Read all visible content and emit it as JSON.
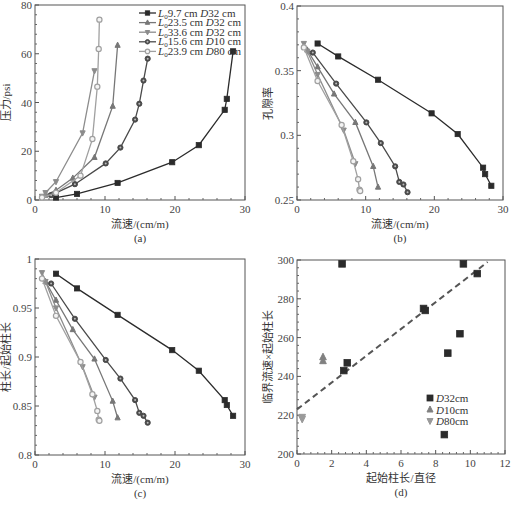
{
  "chart_data": [
    {
      "panel": "a",
      "type": "line",
      "caption": "(a)",
      "xlabel": "流速/(cm/m)",
      "ylabel": "压力/psi",
      "xlim": [
        0,
        30
      ],
      "ylim": [
        0,
        80
      ],
      "xticks": [
        0,
        10,
        20,
        30
      ],
      "yticks": [
        0,
        20,
        40,
        60,
        80
      ],
      "legend_position": "upper right",
      "series": [
        {
          "name": "L0 9.7 cm  D32 cm",
          "legend_main": "9.7 cm",
          "legend_d": "32 cm",
          "marker": "square",
          "color": "#2b2b2b",
          "x": [
            3,
            6,
            11.8,
            19.6,
            23.4,
            27.1,
            27.4,
            28.3
          ],
          "y": [
            1,
            2.5,
            7,
            15.5,
            22.5,
            37,
            41.5,
            61
          ]
        },
        {
          "name": "L0 23.5 cm  D32 cm",
          "legend_main": "23.5 cm",
          "legend_d": "32 cm",
          "marker": "triangle-up",
          "color": "#777777",
          "x": [
            1.5,
            3,
            5.4,
            8.5,
            11.1,
            11.8
          ],
          "y": [
            2,
            4,
            9,
            17.5,
            38.5,
            63.5
          ]
        },
        {
          "name": "L0 33.6 cm  D32 cm",
          "legend_main": "33.6 cm",
          "legend_d": "32 cm",
          "marker": "triangle-down",
          "color": "#8c8c8c",
          "x": [
            1,
            1.5,
            3,
            6.8,
            8.5
          ],
          "y": [
            1.5,
            3,
            7.5,
            27.5,
            53
          ]
        },
        {
          "name": "L0 15.6 cm  D10 cm",
          "legend_main": "15.6 cm",
          "legend_d": "10 cm",
          "marker": "circle-dot",
          "color": "#4a4a4a",
          "x": [
            2.3,
            5.7,
            10.1,
            12.2,
            14.3,
            14.9,
            15.5,
            16.1
          ],
          "y": [
            2,
            6.5,
            15,
            21.5,
            33,
            39.5,
            49,
            58
          ]
        },
        {
          "name": "L0 23.9 cm  D80 cm",
          "legend_main": "23.9 cm",
          "legend_d": "80 cm",
          "marker": "circle-open",
          "color": "#a0a0a0",
          "x": [
            1,
            3,
            6.5,
            8.2,
            8.9,
            9.1,
            9.2
          ],
          "y": [
            1,
            3,
            10,
            25,
            46.5,
            62,
            74
          ]
        }
      ]
    },
    {
      "panel": "b",
      "type": "line",
      "caption": "(b)",
      "xlabel": "流速/(cm/m)",
      "ylabel": "孔隙率",
      "xlim": [
        0,
        30
      ],
      "ylim": [
        0.25,
        0.4
      ],
      "xticks": [
        0,
        10,
        20,
        30
      ],
      "yticks": [
        0.25,
        0.3,
        0.35,
        0.4
      ],
      "series": [
        {
          "name": "L0 9.7 cm  D32 cm",
          "x": [
            3,
            6,
            11.8,
            19.6,
            23.4,
            27.1,
            27.4,
            28.3
          ],
          "y": [
            0.371,
            0.361,
            0.343,
            0.317,
            0.301,
            0.275,
            0.27,
            0.261
          ]
        },
        {
          "name": "L0 23.5 cm  D32 cm",
          "x": [
            1.5,
            3,
            5.4,
            8.5,
            11.1,
            11.8
          ],
          "y": [
            0.366,
            0.353,
            0.332,
            0.31,
            0.276,
            0.26
          ]
        },
        {
          "name": "L0 33.6 cm  D32 cm",
          "x": [
            1,
            1.5,
            3,
            6.8,
            8.5
          ],
          "y": [
            0.371,
            0.365,
            0.347,
            0.304,
            0.278
          ]
        },
        {
          "name": "L0 15.6 cm  D10 cm",
          "x": [
            2.3,
            5.7,
            10.1,
            12.2,
            14.3,
            14.9,
            15.5,
            16.1
          ],
          "y": [
            0.364,
            0.34,
            0.31,
            0.294,
            0.276,
            0.264,
            0.262,
            0.256
          ]
        },
        {
          "name": "L0 23.9 cm  D80 cm",
          "x": [
            1,
            3,
            6.5,
            8.2,
            8.9,
            9.1,
            9.2
          ],
          "y": [
            0.368,
            0.342,
            0.308,
            0.28,
            0.266,
            0.258,
            0.257
          ]
        }
      ]
    },
    {
      "panel": "c",
      "type": "line",
      "caption": "(c)",
      "xlabel": "流速/(cm/m)",
      "ylabel": "柱长/起始柱长",
      "xlim": [
        0,
        30
      ],
      "ylim": [
        0.8,
        1.0
      ],
      "xticks": [
        0,
        10,
        20,
        30
      ],
      "yticks": [
        0.8,
        0.85,
        0.9,
        0.95,
        1
      ],
      "series": [
        {
          "name": "L0 9.7 cm  D32 cm",
          "x": [
            3,
            6,
            11.8,
            19.6,
            23.4,
            27.1,
            27.4,
            28.3
          ],
          "y": [
            0.985,
            0.97,
            0.943,
            0.907,
            0.886,
            0.856,
            0.851,
            0.84
          ]
        },
        {
          "name": "L0 23.5 cm  D32 cm",
          "x": [
            1.5,
            3,
            5.4,
            8.5,
            11.1,
            11.8
          ],
          "y": [
            0.977,
            0.958,
            0.928,
            0.898,
            0.855,
            0.838
          ]
        },
        {
          "name": "L0 33.6 cm  D32 cm",
          "x": [
            1,
            1.5,
            3,
            6.8,
            8.5
          ],
          "y": [
            0.986,
            0.977,
            0.95,
            0.89,
            0.859
          ]
        },
        {
          "name": "L0 15.6 cm  D10 cm",
          "x": [
            2.3,
            5.7,
            10.1,
            12.2,
            14.3,
            14.9,
            15.5,
            16.1
          ],
          "y": [
            0.975,
            0.939,
            0.897,
            0.878,
            0.856,
            0.843,
            0.84,
            0.833
          ]
        },
        {
          "name": "L0 23.9 cm  D80 cm",
          "x": [
            1,
            3,
            6.5,
            8.2,
            8.9,
            9.1,
            9.2
          ],
          "y": [
            0.98,
            0.942,
            0.895,
            0.862,
            0.845,
            0.836,
            0.835
          ]
        }
      ]
    },
    {
      "panel": "d",
      "type": "scatter",
      "caption": "(d)",
      "xlabel": "起始柱长/直径",
      "ylabel": "临界流速×起始柱长",
      "xlim": [
        0,
        12
      ],
      "ylim": [
        200,
        300
      ],
      "xticks": [
        0,
        2,
        4,
        6,
        8,
        10,
        12
      ],
      "yticks": [
        200,
        220,
        240,
        260,
        280,
        300
      ],
      "legend_position": "lower right",
      "series": [
        {
          "name": "D32cm",
          "legend_d": "32cm",
          "marker": "square",
          "color": "#2b2b2b",
          "x": [
            2.6,
            2.7,
            2.9,
            7.3,
            7.4,
            8.5,
            8.7,
            9.4,
            9.6,
            10.4
          ],
          "y": [
            298,
            243,
            247,
            275,
            274,
            210,
            252,
            262,
            298,
            293
          ]
        },
        {
          "name": "D10cm",
          "legend_d": "10cm",
          "marker": "triangle-up",
          "color": "#808080",
          "x": [
            1.5,
            1.5
          ],
          "y": [
            250,
            248
          ]
        },
        {
          "name": "D80cm",
          "legend_d": "80cm",
          "marker": "triangle-down",
          "color": "#9a9a9a",
          "x": [
            0.3,
            0.3
          ],
          "y": [
            219,
            218
          ]
        }
      ],
      "fit_line": {
        "style": "dashed",
        "color": "#555555",
        "x": [
          0,
          11
        ],
        "y": [
          223,
          299
        ]
      }
    }
  ]
}
